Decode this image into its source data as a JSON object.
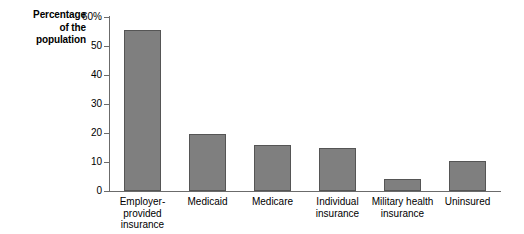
{
  "chart_data": {
    "type": "bar",
    "title": "",
    "subtitle": "",
    "xlabel": "",
    "ylabel": "Percentage of the population",
    "ylabel_lines": [
      "Percentage",
      "of the",
      "population"
    ],
    "categories": [
      "Employer-provided insurance",
      "Medicaid",
      "Medicare",
      "Individual insurance",
      "Military health insurance",
      "Uninsured"
    ],
    "category_lines": [
      [
        "Employer-provided",
        "insurance"
      ],
      [
        "Medicaid"
      ],
      [
        "Medicare"
      ],
      [
        "Individual",
        "insurance"
      ],
      [
        "Military health",
        "insurance"
      ],
      [
        "Uninsured"
      ]
    ],
    "values": [
      55.5,
      19.5,
      16.0,
      15.0,
      4.0,
      10.5
    ],
    "ylim": [
      0,
      60
    ],
    "ytick_values": [
      60,
      50,
      40,
      30,
      20,
      10,
      0
    ],
    "ytick_labels": [
      "60%",
      "50",
      "40",
      "30",
      "20",
      "10",
      "0"
    ],
    "grid": false,
    "legend": false,
    "bar_color": "#7f7f7f",
    "bar_border_color": "#555555",
    "axis_color": "#6b6b6b",
    "background_color": "#ffffff"
  }
}
